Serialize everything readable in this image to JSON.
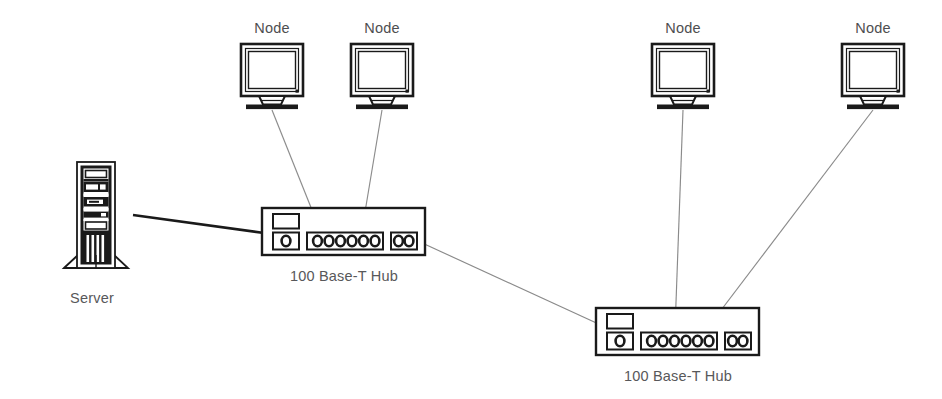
{
  "diagram": {
    "background_color": "#ffffff",
    "line_color_thin": "#8a8a8a",
    "line_color_thick": "#1a1a1a",
    "outline_color": "#1a1a1a",
    "label_color": "#58585a",
    "canvas": {
      "width": 942,
      "height": 399
    }
  },
  "labels": {
    "server": "Server",
    "hub": "100 Base-T Hub",
    "node": "Node"
  },
  "devices": {
    "server": {
      "name": "Server",
      "label": "Server",
      "x": 60,
      "y": 160,
      "width": 72,
      "height": 110,
      "label_x": 92,
      "label_y": 303
    },
    "hubs": [
      {
        "name": "hub-1",
        "label": "100 Base-T Hub",
        "x": 262,
        "y": 208,
        "width": 163,
        "height": 47,
        "label_x": 344,
        "label_y": 281,
        "ports_small": 1,
        "ports_main": 6,
        "ports_uplink": 2
      },
      {
        "name": "hub-2",
        "label": "100 Base-T Hub",
        "x": 596,
        "y": 308,
        "width": 163,
        "height": 47,
        "label_x": 678,
        "label_y": 381,
        "ports_small": 1,
        "ports_main": 6,
        "ports_uplink": 2
      }
    ],
    "nodes": [
      {
        "name": "node-1",
        "label": "Node",
        "x": 241,
        "y": 44,
        "width": 62,
        "height": 60,
        "label_x": 272,
        "label_y": 33
      },
      {
        "name": "node-2",
        "label": "Node",
        "x": 351,
        "y": 44,
        "width": 62,
        "height": 60,
        "label_x": 382,
        "label_y": 33
      },
      {
        "name": "node-3",
        "label": "Node",
        "x": 652,
        "y": 44,
        "width": 62,
        "height": 60,
        "label_x": 683,
        "label_y": 33
      },
      {
        "name": "node-4",
        "label": "Node",
        "x": 842,
        "y": 44,
        "width": 62,
        "height": 60,
        "label_x": 873,
        "label_y": 33
      }
    ]
  },
  "connections": [
    {
      "name": "link-server-to-hub1",
      "from": "Server",
      "to": "100 Base-T Hub",
      "style": "thick",
      "x1": 133,
      "y1": 216,
      "x2": 262,
      "y2": 232
    },
    {
      "name": "link-node1-to-hub1",
      "from": "Node",
      "to": "100 Base-T Hub",
      "style": "thin",
      "x1": 272,
      "y1": 108,
      "x2": 318,
      "y2": 228
    },
    {
      "name": "link-node2-to-hub1",
      "from": "Node",
      "to": "100 Base-T Hub",
      "style": "thin",
      "x1": 382,
      "y1": 108,
      "x2": 363,
      "y2": 228
    },
    {
      "name": "link-hub1-to-hub2",
      "from": "100 Base-T Hub",
      "to": "100 Base-T Hub",
      "style": "thin",
      "x1": 424,
      "y1": 243,
      "x2": 614,
      "y2": 330
    },
    {
      "name": "link-node3-to-hub2",
      "from": "Node",
      "to": "100 Base-T Hub",
      "style": "thin",
      "x1": 683,
      "y1": 108,
      "x2": 675,
      "y2": 328
    },
    {
      "name": "link-node4-to-hub2",
      "from": "Node",
      "to": "100 Base-T Hub",
      "style": "thin",
      "x1": 873,
      "y1": 108,
      "x2": 708,
      "y2": 328
    }
  ]
}
